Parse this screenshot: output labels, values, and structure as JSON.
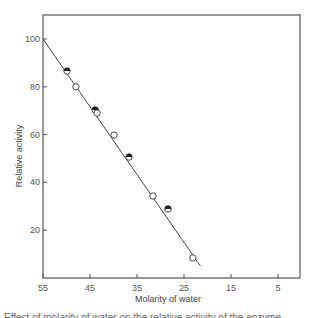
{
  "chart_data": {
    "type": "scatter",
    "title": "",
    "xlabel": "Molarity of water",
    "ylabel": "Relative activity",
    "xlim": [
      55,
      0
    ],
    "ylim": [
      0,
      110
    ],
    "x_reversed": true,
    "grid": false,
    "legend": null,
    "x_ticks": [
      55,
      45,
      35,
      25,
      15,
      5
    ],
    "y_ticks": [
      20,
      40,
      60,
      80,
      100
    ],
    "x_tick_labels": [
      "55",
      "45",
      "35",
      "25",
      "15",
      "5"
    ],
    "y_tick_labels": [
      "20",
      "40",
      "60",
      "80",
      "100"
    ],
    "series": [
      {
        "name": "half-filled circles",
        "marker": "half-filled-circle",
        "points": [
          [
            49.9,
            86.6
          ],
          [
            43.9,
            70.3
          ],
          [
            36.7,
            50.6
          ],
          [
            28.4,
            28.9
          ]
        ]
      },
      {
        "name": "open circles",
        "marker": "open-circle",
        "points": [
          [
            48.0,
            80.0
          ],
          [
            43.5,
            69.0
          ],
          [
            39.9,
            59.8
          ],
          [
            31.6,
            34.3
          ],
          [
            23.1,
            8.4
          ]
        ]
      }
    ],
    "fit_line": {
      "type": "linear",
      "start": [
        55,
        100
      ],
      "end": [
        21.5,
        5.0
      ]
    }
  },
  "caption_fragment": "Effect of molarity of water on the relative activity of the enzyme"
}
